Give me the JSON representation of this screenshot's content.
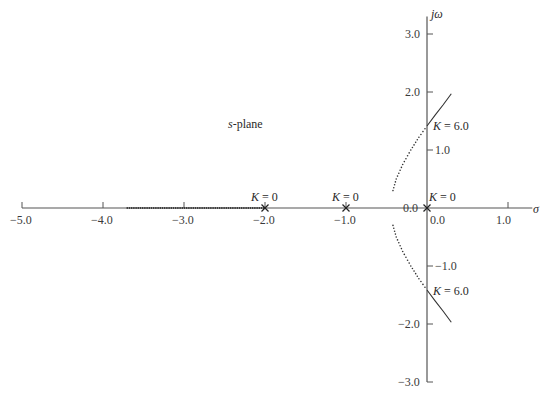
{
  "chart_data": {
    "type": "line",
    "title": "",
    "annotation_plane": "s-plane",
    "xlabel": "σ",
    "ylabel": "jω",
    "xlim": [
      -5.0,
      1.3
    ],
    "ylim": [
      -3.0,
      3.3
    ],
    "xticks": [
      -5.0,
      -4.0,
      -3.0,
      -2.0,
      -1.0,
      0.0,
      1.0
    ],
    "xtick_labels": [
      "−5.0",
      "−4.0",
      "−3.0",
      "−2.0",
      "−1.0",
      "0.0",
      "1.0"
    ],
    "yticks": [
      3.0,
      2.0,
      1.0,
      0.0,
      -1.0,
      -2.0,
      -3.0
    ],
    "ytick_labels": [
      "3.0",
      "2.0",
      "1.0",
      "0.0",
      "−1.0",
      "−2.0",
      "−3.0"
    ],
    "grid": false,
    "poles": [
      {
        "x": 0.0,
        "y": 0.0,
        "label": "K = 0"
      },
      {
        "x": -1.0,
        "y": 0.0,
        "label": "K = 0"
      },
      {
        "x": -2.0,
        "y": 0.0,
        "label": "K = 0"
      }
    ],
    "crossings": [
      {
        "x": 0.0,
        "y": 1.414,
        "label": "K = 6.0"
      },
      {
        "x": 0.0,
        "y": -1.414,
        "label": "K = 6.0"
      }
    ],
    "series": [
      {
        "name": "real-axis branch",
        "style": "dotted",
        "points": [
          [
            -2.0,
            0.0
          ],
          [
            -3.7,
            0.0
          ]
        ]
      },
      {
        "name": "upper branch",
        "style": "dotted-then-solid",
        "points": [
          [
            -0.42,
            0.3
          ],
          [
            -0.38,
            0.5
          ],
          [
            -0.3,
            0.75
          ],
          [
            -0.2,
            1.0
          ],
          [
            -0.1,
            1.22
          ],
          [
            0.0,
            1.414
          ],
          [
            0.1,
            1.6
          ],
          [
            0.2,
            1.78
          ],
          [
            0.3,
            1.97
          ]
        ]
      },
      {
        "name": "lower branch",
        "style": "dotted-then-solid",
        "points": [
          [
            -0.42,
            -0.3
          ],
          [
            -0.38,
            -0.5
          ],
          [
            -0.3,
            -0.75
          ],
          [
            -0.2,
            -1.0
          ],
          [
            -0.1,
            -1.22
          ],
          [
            0.0,
            -1.414
          ],
          [
            0.1,
            -1.6
          ],
          [
            0.2,
            -1.78
          ],
          [
            0.3,
            -1.97
          ]
        ]
      }
    ]
  }
}
